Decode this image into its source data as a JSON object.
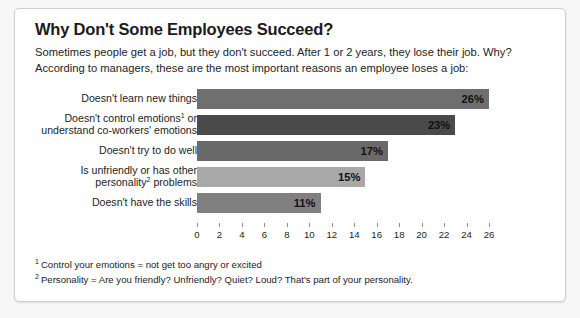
{
  "card": {
    "title": "Why Don't Some Employees Succeed?",
    "subtitle": "Sometimes people get a job, but they don't succeed. After 1 or 2 years, they lose their job. Why? According to managers, these are the most important reasons an employee loses a job:"
  },
  "footnotes": [
    {
      "marker": "1",
      "text": "Control your emotions = not get too angry or excited"
    },
    {
      "marker": "2",
      "text": "Personality = Are you friendly? Unfriendly? Quiet? Loud? That's part of your personality."
    }
  ],
  "chart_data": {
    "type": "bar",
    "orientation": "horizontal",
    "title": "Why Don't Some Employees Succeed?",
    "xlabel": "",
    "ylabel": "",
    "xlim": [
      0,
      26
    ],
    "grid": false,
    "legend": false,
    "tick_step": 2,
    "ticks": [
      0,
      2,
      4,
      6,
      8,
      10,
      12,
      14,
      16,
      18,
      20,
      22,
      24,
      26
    ],
    "categories": [
      "Doesn't learn new things",
      "Doesn't control emotions¹ or understand co-workers' emotions",
      "Doesn't try to do well",
      "Is unfriendly or has other personality² problems",
      "Doesn't have the skills"
    ],
    "values": [
      26,
      23,
      17,
      15,
      11
    ],
    "data_labels": [
      "26%",
      "23%",
      "17%",
      "15%",
      "11%"
    ],
    "bar_colors": [
      "#6f6f6f",
      "#4a4a4a",
      "#6a6a6a",
      "#a8a8a8",
      "#808080"
    ]
  },
  "bars": [
    {
      "label_html": "Doesn't learn new things",
      "value_label": "26%",
      "value": 26,
      "color": "#6f6f6f"
    },
    {
      "label_html": "Doesn't control emotions<sup>1</sup> or<br>understand co-workers' emotions",
      "value_label": "23%",
      "value": 23,
      "color": "#4a4a4a"
    },
    {
      "label_html": "Doesn't try to do well",
      "value_label": "17%",
      "value": 17,
      "color": "#6a6a6a"
    },
    {
      "label_html": "Is unfriendly or has other<br>personality<sup>2</sup> problems",
      "value_label": "15%",
      "value": 15,
      "color": "#a8a8a8"
    },
    {
      "label_html": "Doesn't have the skills",
      "value_label": "11%",
      "value": 11,
      "color": "#808080"
    }
  ]
}
